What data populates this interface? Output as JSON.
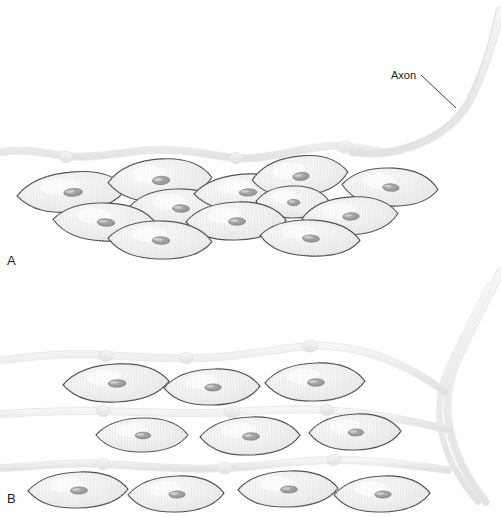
{
  "figure": {
    "background": "#ffffff",
    "width": 501,
    "height": 516
  },
  "annotations": [
    {
      "name": "axon-label",
      "text": "Axon",
      "x": 391,
      "y": 79,
      "leader": {
        "x1": 421,
        "y1": 75,
        "x2": 456,
        "y2": 108
      }
    }
  ],
  "panels": [
    {
      "name": "panel-a",
      "label": "A",
      "x": 7,
      "y": 265
    },
    {
      "name": "panel-b",
      "label": "B",
      "x": 7,
      "y": 503
    }
  ],
  "colors": {
    "cell_fill": "#f1f1f1",
    "cell_fill_highlight": "#fbfbfb",
    "cell_stroke": "#4a4a4a",
    "nucleus_fill": "#9a9a9a",
    "nucleus_stroke": "#7d7d7d",
    "axon_fill": "#ededed",
    "axon_stroke": "#e0e0e0",
    "label_color": "#1a1a1a",
    "leader_color": "#2a2a2a",
    "background": "#ffffff"
  },
  "panel_a": {
    "description": "Multiunit smooth muscle: a single varicose axon passes over a staggered cluster of spindle-shaped smooth muscle cells.",
    "axon_path": "M 1,152 C 30,148 48,154 66,156 C 92,159 120,152 150,150 C 185,148 212,156 236,158 C 268,160 300,148 330,146 C 350,145 365,149 382,152",
    "axon_width": 7,
    "varicosities": [
      {
        "cx": 66,
        "cy": 157,
        "rx": 7,
        "ry": 5.5
      },
      {
        "cx": 236,
        "cy": 158,
        "rx": 7,
        "ry": 5.5
      },
      {
        "cx": 345,
        "cy": 147,
        "rx": 8,
        "ry": 6
      }
    ],
    "cells": [
      {
        "cx": 72,
        "cy": 192,
        "rx": 55,
        "ry": 20,
        "rot": -4
      },
      {
        "cx": 160,
        "cy": 180,
        "rx": 52,
        "ry": 21,
        "rot": -3
      },
      {
        "cx": 180,
        "cy": 208,
        "rx": 50,
        "ry": 19,
        "rot": 2
      },
      {
        "cx": 247,
        "cy": 192,
        "rx": 53,
        "ry": 18,
        "rot": -2
      },
      {
        "cx": 300,
        "cy": 176,
        "rx": 48,
        "ry": 20,
        "rot": -5
      },
      {
        "cx": 390,
        "cy": 187,
        "rx": 48,
        "ry": 19,
        "rot": 3
      },
      {
        "cx": 293,
        "cy": 202,
        "rx": 37,
        "ry": 16,
        "rot": 1
      },
      {
        "cx": 105,
        "cy": 222,
        "rx": 52,
        "ry": 19,
        "rot": 3
      },
      {
        "cx": 236,
        "cy": 221,
        "rx": 50,
        "ry": 19,
        "rot": -1
      },
      {
        "cx": 350,
        "cy": 216,
        "rx": 48,
        "ry": 19,
        "rot": -3
      },
      {
        "cx": 160,
        "cy": 240,
        "rx": 52,
        "ry": 19,
        "rot": 2
      },
      {
        "cx": 310,
        "cy": 238,
        "rx": 50,
        "ry": 18,
        "rot": 3
      }
    ]
  },
  "panel_b": {
    "description": "Single-unit smooth muscle: the axon descends at the right and branches into several varicose fibers running between rows of smooth muscle cells.",
    "descending_axon": "M 497,274 C 480,310 462,340 452,366 C 442,392 444,420 452,444 C 458,462 470,480 482,495",
    "descending_axon_2": "M 488,284 C 470,320 452,350 442,376 C 432,402 434,428 442,452 C 448,470 460,486 472,500",
    "fibers": [
      {
        "name": "fiber-top",
        "path": "M 1,360 C 40,356 70,352 106,355 C 150,358 190,360 230,356 C 270,352 300,344 330,346 C 370,349 410,366 445,392",
        "varicosities": [
          {
            "cx": 106,
            "cy": 356,
            "rx": 7,
            "ry": 5.5
          },
          {
            "cx": 186,
            "cy": 358,
            "rx": 7,
            "ry": 5.5
          },
          {
            "cx": 310,
            "cy": 346,
            "rx": 8,
            "ry": 6
          }
        ]
      },
      {
        "name": "fiber-middle",
        "path": "M 1,414 C 40,412 70,410 103,411 C 160,413 200,414 232,412 C 270,410 300,408 327,410 C 370,413 410,420 450,430",
        "varicosities": [
          {
            "cx": 103,
            "cy": 411,
            "rx": 7,
            "ry": 5.5
          },
          {
            "cx": 232,
            "cy": 412,
            "rx": 8,
            "ry": 6
          },
          {
            "cx": 327,
            "cy": 410,
            "rx": 7,
            "ry": 5.5
          }
        ]
      },
      {
        "name": "fiber-bottom",
        "path": "M 1,468 C 40,466 70,462 103,464 C 150,467 190,470 225,468 C 270,466 300,460 334,460 C 380,460 415,466 448,470",
        "varicosities": [
          {
            "cx": 103,
            "cy": 464,
            "rx": 7,
            "ry": 5.5
          },
          {
            "cx": 225,
            "cy": 468,
            "rx": 8,
            "ry": 6
          },
          {
            "cx": 334,
            "cy": 460,
            "rx": 7,
            "ry": 5.5
          }
        ]
      }
    ],
    "rows": [
      {
        "name": "cell-row-1",
        "cells": [
          {
            "cx": 116,
            "cy": 383,
            "rx": 53,
            "ry": 19,
            "rot": -2
          },
          {
            "cx": 212,
            "cy": 387,
            "rx": 48,
            "ry": 18,
            "rot": -1
          },
          {
            "cx": 315,
            "cy": 382,
            "rx": 50,
            "ry": 19,
            "rot": -1
          }
        ]
      },
      {
        "name": "cell-row-2",
        "cells": [
          {
            "cx": 142,
            "cy": 435,
            "rx": 46,
            "ry": 17,
            "rot": 0
          },
          {
            "cx": 250,
            "cy": 436,
            "rx": 50,
            "ry": 19,
            "rot": -1
          },
          {
            "cx": 355,
            "cy": 432,
            "rx": 46,
            "ry": 18,
            "rot": -1
          }
        ]
      },
      {
        "name": "cell-row-3",
        "cells": [
          {
            "cx": 78,
            "cy": 490,
            "rx": 50,
            "ry": 18,
            "rot": -1
          },
          {
            "cx": 176,
            "cy": 494,
            "rx": 48,
            "ry": 18,
            "rot": -1
          },
          {
            "cx": 288,
            "cy": 489,
            "rx": 50,
            "ry": 18,
            "rot": -1
          },
          {
            "cx": 382,
            "cy": 494,
            "rx": 48,
            "ry": 18,
            "rot": -1
          }
        ]
      }
    ]
  }
}
